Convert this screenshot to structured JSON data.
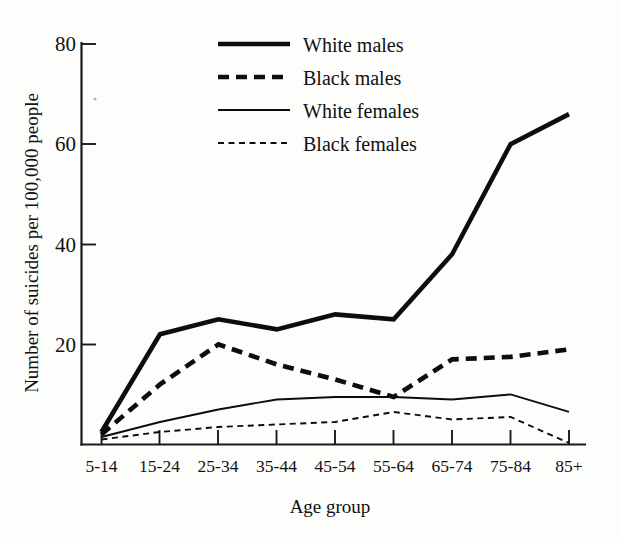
{
  "chart_data": {
    "type": "line",
    "title": "",
    "xlabel": "Age group",
    "ylabel": "Number of suicides per 100,000 people",
    "categories": [
      "5-14",
      "15-24",
      "25-34",
      "35-44",
      "45-54",
      "55-64",
      "65-74",
      "75-84",
      "85+"
    ],
    "ylim": [
      0,
      80
    ],
    "yticks": [
      20,
      40,
      60,
      80
    ],
    "ytick_labels": [
      "20",
      "40",
      "60",
      "80"
    ],
    "grid": false,
    "legend_position": "top-center",
    "series": [
      {
        "name": "White males",
        "style": "thick-solid",
        "color": "#0d0d0d",
        "values": [
          2.5,
          22,
          25,
          23,
          26,
          25,
          38,
          60,
          66
        ]
      },
      {
        "name": "Black males",
        "style": "thick-dashed",
        "color": "#0d0d0d",
        "values": [
          2,
          12,
          20,
          16,
          13,
          9.5,
          17,
          17.5,
          19
        ]
      },
      {
        "name": "White females",
        "style": "thin-solid",
        "color": "#0d0d0d",
        "values": [
          1.5,
          4.5,
          7,
          9,
          9.5,
          9.5,
          9,
          10,
          6.5
        ]
      },
      {
        "name": "Black females",
        "style": "thin-dotted",
        "color": "#0d0d0d",
        "values": [
          1,
          2.5,
          3.5,
          4,
          4.5,
          6.5,
          5,
          5.5,
          0.3
        ]
      }
    ]
  },
  "legend": {
    "items": [
      {
        "label": "White males"
      },
      {
        "label": "Black males"
      },
      {
        "label": "White females"
      },
      {
        "label": "Black females"
      }
    ]
  }
}
